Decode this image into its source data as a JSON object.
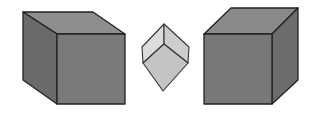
{
  "figure": {
    "colors": {
      "background": "#ffffff",
      "edge": "#222222",
      "dark_top": "#8c8c8c",
      "dark_front": "#777777",
      "dark_side": "#666666",
      "light_left": "#d6d6d6",
      "light_right": "#c8c8c8",
      "light_bottom": "#c2c2c2"
    },
    "cubes": [
      {
        "name": "left-cube",
        "view": "from-top-left"
      },
      {
        "name": "middle-cube",
        "view": "isometric-small"
      },
      {
        "name": "right-cube",
        "view": "from-top-right"
      }
    ]
  }
}
